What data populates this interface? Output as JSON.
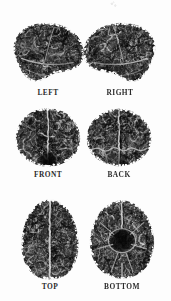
{
  "figure": {
    "title": "",
    "background_color": "#fdfdfd",
    "layout": {
      "columns": 2,
      "rows": 3
    },
    "views": [
      {
        "id": "left",
        "label": "LEFT",
        "orientation": "lateral-left",
        "row": 1,
        "column": 1,
        "label_center_x": 48,
        "label_y": 88
      },
      {
        "id": "right",
        "label": "RIGHT",
        "orientation": "lateral-right",
        "row": 1,
        "column": 2,
        "label_center_x": 117,
        "label_y": 88
      },
      {
        "id": "front",
        "label": "FRONT",
        "orientation": "anterior",
        "row": 2,
        "column": 1,
        "label_center_x": 48,
        "label_y": 172
      },
      {
        "id": "back",
        "label": "BACK",
        "orientation": "posterior",
        "row": 2,
        "column": 2,
        "label_center_x": 118,
        "label_y": 172
      },
      {
        "id": "top",
        "label": "TOP",
        "orientation": "superior",
        "row": 3,
        "column": 1,
        "label_center_x": 50,
        "label_y": 286
      },
      {
        "id": "bottom",
        "label": "BOTTOM",
        "orientation": "inferior",
        "row": 3,
        "column": 2,
        "label_center_x": 121,
        "label_y": 286
      }
    ]
  },
  "render": {
    "surface_base_color": "#3c3c3c",
    "surface_dark_color": "#1d1d1d",
    "sulcus_line_color": "#b8b8b8",
    "highlight_color": "#d8d8d8",
    "label_color": "#2b2b2b",
    "midline_color": "#cfcfcf"
  }
}
